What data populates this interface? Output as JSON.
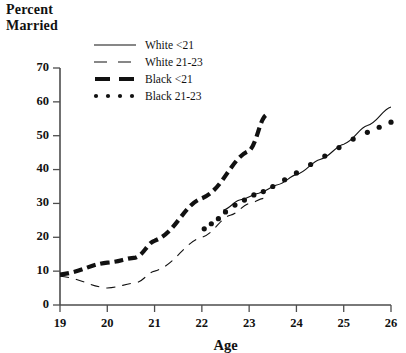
{
  "title": {
    "line1": "Percent",
    "line2": "Married"
  },
  "legend": {
    "position": "top-center",
    "items": [
      {
        "label": "White <21",
        "style": "solid-thin",
        "key": "white_lt21"
      },
      {
        "label": "White 21-23",
        "style": "dashed-thin",
        "key": "white_21_23"
      },
      {
        "label": "Black <21",
        "style": "dashed-thick",
        "key": "black_lt21"
      },
      {
        "label": "Black 21-23",
        "style": "dotted",
        "key": "black_21_23"
      }
    ]
  },
  "chart_data": {
    "type": "line",
    "title": "Percent Married",
    "xlabel": "Age",
    "ylabel": "Percent Married",
    "xlim": [
      19,
      26
    ],
    "ylim": [
      0,
      70
    ],
    "xticks": [
      19,
      20,
      21,
      22,
      23,
      24,
      25,
      26
    ],
    "yticks": [
      0,
      10,
      20,
      30,
      40,
      50,
      60,
      70
    ],
    "grid": false,
    "series": [
      {
        "name": "White <21",
        "style": "solid-thin",
        "color": "#111111",
        "points": [
          [
            22.45,
            28.0
          ],
          [
            22.8,
            31.0
          ],
          [
            23.2,
            33.0
          ],
          [
            23.6,
            35.5
          ],
          [
            24.0,
            38.5
          ],
          [
            24.5,
            43.0
          ],
          [
            25.0,
            47.5
          ],
          [
            25.5,
            53.0
          ],
          [
            26.0,
            58.5
          ]
        ]
      },
      {
        "name": "White 21-23",
        "style": "dashed-thin",
        "color": "#111111",
        "points": [
          [
            19.0,
            8.5
          ],
          [
            20.0,
            5.0
          ],
          [
            20.6,
            6.5
          ],
          [
            21.0,
            10.0
          ],
          [
            22.0,
            20.0
          ],
          [
            22.6,
            26.5
          ],
          [
            23.0,
            30.0
          ],
          [
            23.3,
            31.5
          ]
        ]
      },
      {
        "name": "Black <21",
        "style": "dashed-thick",
        "color": "#111111",
        "points": [
          [
            19.0,
            9.0
          ],
          [
            20.0,
            12.5
          ],
          [
            20.6,
            14.0
          ],
          [
            21.0,
            19.0
          ],
          [
            22.0,
            31.5
          ],
          [
            23.0,
            45.5
          ],
          [
            23.35,
            56.0
          ]
        ]
      },
      {
        "name": "Black 21-23",
        "style": "dotted",
        "color": "#111111",
        "points": [
          [
            22.05,
            22.5
          ],
          [
            22.2,
            24.0
          ],
          [
            22.35,
            25.5
          ],
          [
            22.5,
            27.5
          ],
          [
            22.7,
            29.5
          ],
          [
            22.9,
            31.0
          ],
          [
            23.1,
            32.5
          ],
          [
            23.3,
            33.5
          ],
          [
            23.5,
            35.0
          ],
          [
            23.75,
            37.0
          ],
          [
            24.0,
            39.0
          ],
          [
            24.3,
            41.5
          ],
          [
            24.6,
            44.0
          ],
          [
            24.9,
            46.5
          ],
          [
            25.2,
            49.0
          ],
          [
            25.5,
            51.0
          ],
          [
            25.75,
            52.5
          ],
          [
            26.0,
            54.0
          ]
        ]
      }
    ]
  }
}
